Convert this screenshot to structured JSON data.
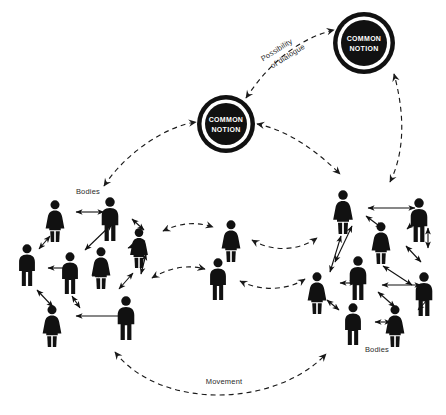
{
  "diagram": {
    "background_color": "#ffffff",
    "ink_color": "#111111",
    "width": 446,
    "height": 415
  },
  "nodes": [
    {
      "id": "common-notion-center",
      "line1": "COMMON",
      "line2": "NOTION",
      "cx": 226,
      "cy": 124,
      "r": 29
    },
    {
      "id": "common-notion-topright",
      "line1": "COMMON",
      "line2": "NOTION",
      "cx": 364,
      "cy": 43,
      "r": 31
    }
  ],
  "labels": {
    "bodies_left": "Bodies",
    "bodies_right": "Bodies",
    "movement": "Movement",
    "possibility_line1": "Possibility",
    "possibility_line2": "of dialogue"
  },
  "clusters": {
    "left": {
      "label": "Bodies",
      "figures": [
        {
          "type": "female",
          "x": 55,
          "y": 200,
          "h": 42
        },
        {
          "type": "male",
          "x": 110,
          "y": 197,
          "h": 44
        },
        {
          "type": "female",
          "x": 139,
          "y": 228,
          "h": 40
        },
        {
          "type": "male",
          "x": 27,
          "y": 244,
          "h": 42
        },
        {
          "type": "male",
          "x": 70,
          "y": 252,
          "h": 42
        },
        {
          "type": "female",
          "x": 101,
          "y": 247,
          "h": 42
        },
        {
          "type": "female",
          "x": 52,
          "y": 305,
          "h": 42
        },
        {
          "type": "male",
          "x": 126,
          "y": 296,
          "h": 44
        }
      ]
    },
    "center": {
      "figures": [
        {
          "type": "female",
          "x": 231,
          "y": 220,
          "h": 42
        },
        {
          "type": "male",
          "x": 218,
          "y": 258,
          "h": 42
        }
      ]
    },
    "right": {
      "label": "Bodies",
      "figures": [
        {
          "type": "female",
          "x": 343,
          "y": 190,
          "h": 44
        },
        {
          "type": "male",
          "x": 419,
          "y": 198,
          "h": 44
        },
        {
          "type": "female",
          "x": 381,
          "y": 222,
          "h": 42
        },
        {
          "type": "male",
          "x": 358,
          "y": 256,
          "h": 44
        },
        {
          "type": "female",
          "x": 317,
          "y": 272,
          "h": 42
        },
        {
          "type": "male",
          "x": 424,
          "y": 272,
          "h": 44
        },
        {
          "type": "male",
          "x": 353,
          "y": 303,
          "h": 42
        },
        {
          "type": "female",
          "x": 395,
          "y": 305,
          "h": 42
        }
      ]
    }
  },
  "connections": {
    "solid_count": 22,
    "dashed_count": 7,
    "arrow_style": "double-headed"
  }
}
